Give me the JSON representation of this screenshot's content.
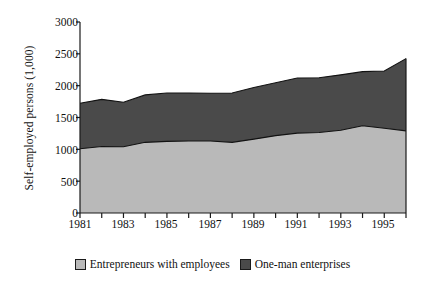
{
  "chart_data": {
    "type": "area",
    "title": "",
    "subtitle": "",
    "xlabel": "",
    "ylabel": "Self-employed persons (1,000)",
    "stacked": true,
    "grid": false,
    "legend_position": "bottom",
    "xlim": [
      1981,
      1996
    ],
    "ylim": [
      0,
      3000
    ],
    "y_ticks": [
      0,
      500,
      1000,
      1500,
      2000,
      2500,
      3000
    ],
    "y_tick_labels": [
      "0",
      "500",
      "1000",
      "1500",
      "2000",
      "2500",
      "3000"
    ],
    "x_ticks": [
      1981,
      1982,
      1983,
      1984,
      1985,
      1986,
      1987,
      1988,
      1989,
      1990,
      1991,
      1992,
      1993,
      1994,
      1995,
      1996
    ],
    "x_tick_labels": [
      "1981",
      "",
      "1983",
      "",
      "1985",
      "",
      "1987",
      "",
      "1989",
      "",
      "1991",
      "",
      "1993",
      "",
      "1995",
      ""
    ],
    "x_labeled_ticks": [
      1981,
      1983,
      1985,
      1987,
      1989,
      1991,
      1993,
      1995
    ],
    "x": [
      1981,
      1982,
      1983,
      1984,
      1985,
      1986,
      1987,
      1988,
      1989,
      1990,
      1991,
      1992,
      1993,
      1994,
      1995,
      1996
    ],
    "series": [
      {
        "name": "Entrepreneurs with employees",
        "color": "#b9b9b9",
        "values": [
          1010,
          1045,
          1040,
          1110,
          1125,
          1130,
          1130,
          1110,
          1160,
          1215,
          1255,
          1265,
          1300,
          1370,
          1330,
          1290
        ]
      },
      {
        "name": "One-man enterprises",
        "color": "#4a4a4a",
        "values": [
          715,
          740,
          700,
          745,
          760,
          755,
          750,
          775,
          810,
          830,
          865,
          860,
          870,
          850,
          900,
          1135
        ]
      }
    ],
    "totals": [
      1725,
      1785,
      1740,
      1855,
      1885,
      1885,
      1880,
      1885,
      1970,
      2045,
      2120,
      2125,
      2170,
      2220,
      2230,
      2425
    ]
  },
  "legend": {
    "items": [
      {
        "label": "Entrepreneurs with employees",
        "color": "#b9b9b9"
      },
      {
        "label": "One-man enterprises",
        "color": "#4a4a4a"
      }
    ]
  },
  "axes": {
    "y_label": "Self-employed persons (1,000)",
    "y_tick_labels": [
      "3000",
      "2500",
      "2000",
      "1500",
      "1000",
      "500",
      "0"
    ],
    "x_tick_labels": [
      "1981",
      "1983",
      "1985",
      "1987",
      "1989",
      "1991",
      "1993",
      "1995"
    ]
  },
  "colors": {
    "series_light": "#b9b9b9",
    "series_dark": "#4a4a4a",
    "axis": "#1a1a1a",
    "background": "#ffffff"
  }
}
